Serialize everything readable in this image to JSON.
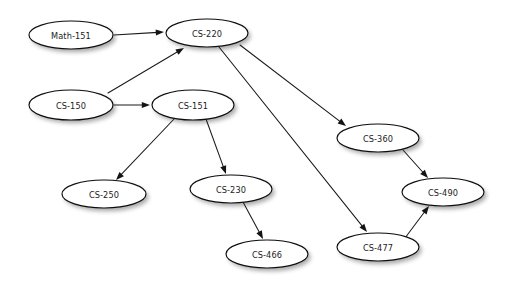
{
  "diagram": {
    "type": "directed-graph",
    "background_color": "#ffffff",
    "node_fill_color": "#ffffff",
    "node_stroke_color": "#0d0d0d",
    "edge_color": "#1a1a1a",
    "label_color": "#1c1c1c",
    "nodes": [
      {
        "id": "math151",
        "label": "Math-151",
        "cx": 71,
        "cy": 35,
        "rx": 42,
        "ry": 14
      },
      {
        "id": "cs220",
        "label": "CS-220",
        "cx": 207,
        "cy": 33,
        "rx": 41,
        "ry": 14
      },
      {
        "id": "cs150",
        "label": "CS-150",
        "cx": 71,
        "cy": 105,
        "rx": 42,
        "ry": 15
      },
      {
        "id": "cs151",
        "label": "CS-151",
        "cx": 193,
        "cy": 105,
        "rx": 41,
        "ry": 15
      },
      {
        "id": "cs250",
        "label": "CS-250",
        "cx": 104,
        "cy": 194,
        "rx": 42,
        "ry": 14
      },
      {
        "id": "cs230",
        "label": "CS-230",
        "cx": 231,
        "cy": 189,
        "rx": 41,
        "ry": 14
      },
      {
        "id": "cs466",
        "label": "CS-466",
        "cx": 267,
        "cy": 254,
        "rx": 41,
        "ry": 14
      },
      {
        "id": "cs360",
        "label": "CS-360",
        "cx": 378,
        "cy": 138,
        "rx": 41,
        "ry": 14
      },
      {
        "id": "cs477",
        "label": "CS-477",
        "cx": 378,
        "cy": 247,
        "rx": 41,
        "ry": 14
      },
      {
        "id": "cs490",
        "label": "CS-490",
        "cx": 443,
        "cy": 192,
        "rx": 41,
        "ry": 14
      }
    ],
    "edges": [
      {
        "id": "e1",
        "from": "math151",
        "to": "cs220",
        "x1": 114,
        "y1": 35,
        "x2": 164,
        "y2": 32
      },
      {
        "id": "e2",
        "from": "cs150",
        "to": "cs220",
        "x1": 108,
        "y1": 93,
        "x2": 184,
        "y2": 48
      },
      {
        "id": "e3",
        "from": "cs150",
        "to": "cs151",
        "x1": 114,
        "y1": 105,
        "x2": 150,
        "y2": 105
      },
      {
        "id": "e4",
        "from": "cs151",
        "to": "cs250",
        "x1": 175,
        "y1": 118,
        "x2": 116,
        "y2": 180
      },
      {
        "id": "e5",
        "from": "cs151",
        "to": "cs230",
        "x1": 206,
        "y1": 119,
        "x2": 226,
        "y2": 174
      },
      {
        "id": "e6",
        "from": "cs230",
        "to": "cs466",
        "x1": 243,
        "y1": 202,
        "x2": 263,
        "y2": 239
      },
      {
        "id": "e7",
        "from": "cs220",
        "to": "cs360",
        "x1": 240,
        "y1": 45,
        "x2": 346,
        "y2": 126
      },
      {
        "id": "e8",
        "from": "cs220",
        "to": "cs477",
        "x1": 219,
        "y1": 47,
        "x2": 367,
        "y2": 232
      },
      {
        "id": "e9",
        "from": "cs360",
        "to": "cs490",
        "x1": 403,
        "y1": 150,
        "x2": 428,
        "y2": 178
      },
      {
        "id": "e10",
        "from": "cs477",
        "to": "cs490",
        "x1": 405,
        "y1": 238,
        "x2": 429,
        "y2": 206
      }
    ]
  }
}
